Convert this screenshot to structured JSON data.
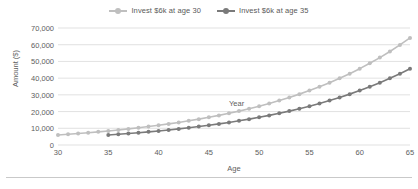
{
  "chart_data": {
    "type": "line",
    "title": "",
    "subtitle": "",
    "xlabel": "Age",
    "ylabel": "Amount ($)",
    "xlim": [
      30,
      65
    ],
    "ylim": [
      0,
      70000
    ],
    "grid": true,
    "legend_position": "top-center",
    "x_tick_labels": [
      "30",
      "35",
      "40",
      "45",
      "50",
      "55",
      "60",
      "65"
    ],
    "x_ticks": [
      30,
      35,
      40,
      45,
      50,
      55,
      60,
      65
    ],
    "y_tick_labels": [
      "0",
      "10,000",
      "20,000",
      "30,000",
      "40,000",
      "50,000",
      "60,000",
      "70,000"
    ],
    "y_ticks": [
      0,
      10000,
      20000,
      30000,
      40000,
      50000,
      60000,
      70000
    ],
    "annotations": [
      {
        "text": "Year",
        "x": 48,
        "y": 24500
      }
    ],
    "x": [
      30,
      31,
      32,
      33,
      34,
      35,
      36,
      37,
      38,
      39,
      40,
      41,
      42,
      43,
      44,
      45,
      46,
      47,
      48,
      49,
      50,
      51,
      52,
      53,
      54,
      55,
      56,
      57,
      58,
      59,
      60,
      61,
      62,
      63,
      64,
      65
    ],
    "series": [
      {
        "name": "Invest $6k at age 30",
        "color": "#bfbfbf",
        "marker": "circle",
        "values": [
          6000,
          6420,
          6869,
          7350,
          7865,
          8415,
          9004,
          9634,
          10309,
          11030,
          11802,
          12628,
          13512,
          14458,
          15470,
          16553,
          17712,
          18952,
          20278,
          21698,
          23216,
          24842,
          26581,
          28442,
          30433,
          32563,
          34842,
          37281,
          39891,
          42683,
          45671,
          48868,
          52289,
          55949,
          59866,
          64057
        ]
      },
      {
        "name": "Invest $6k at age 35",
        "color": "#7a7a7a",
        "marker": "circle",
        "values": [
          null,
          null,
          null,
          null,
          null,
          6000,
          6420,
          6869,
          7350,
          7865,
          8415,
          9004,
          9634,
          10309,
          11030,
          11802,
          12628,
          13512,
          14458,
          15470,
          16553,
          17712,
          18952,
          20278,
          21698,
          23216,
          24842,
          26581,
          28442,
          30433,
          32563,
          34842,
          37281,
          39891,
          42683,
          45671
        ]
      }
    ]
  },
  "legend": {
    "items": [
      {
        "label": "Invest $6k at age 30",
        "color": "#bfbfbf"
      },
      {
        "label": "Invest $6k at age 35",
        "color": "#7a7a7a"
      }
    ]
  },
  "axes": {
    "x_title": "Age",
    "y_title": "Amount ($)"
  },
  "colors": {
    "series_light": "#bfbfbf",
    "series_dark": "#7a7a7a",
    "gridline": "#d9d9d9",
    "text": "#5e5e5e",
    "background": "#ffffff"
  }
}
